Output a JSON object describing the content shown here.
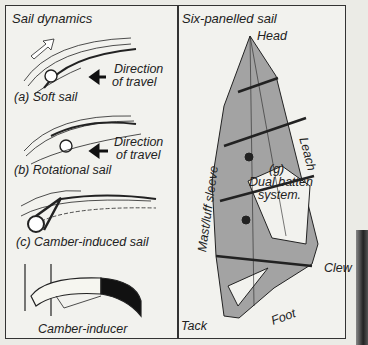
{
  "left_panel": {
    "title": "Sail dynamics",
    "diagrams": [
      {
        "caption": "(a) Soft sail",
        "direction_line1": "Direction",
        "direction_line2": "of travel"
      },
      {
        "caption": "(b) Rotational sail",
        "direction_line1": "Direction",
        "direction_line2": "of travel"
      },
      {
        "caption": "(c) Camber-induced sail"
      },
      {
        "caption": "Camber-inducer"
      }
    ]
  },
  "right_panel": {
    "title": "Six-panelled sail",
    "labels": {
      "head": "Head",
      "leach": "Leach",
      "mast_sleeve": "Mast/luff sleeve",
      "batten_g": "(g)",
      "batten_line1": "Dual batten",
      "batten_line2": "system.",
      "clew": "Clew",
      "tack": "Tack",
      "foot": "Foot"
    }
  },
  "colors": {
    "sail_panel": "#a3a3a3",
    "background": "#f2f2ee",
    "lines": "#222222"
  }
}
